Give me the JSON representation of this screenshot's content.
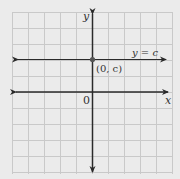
{
  "figure": {
    "type": "coordinate-plane",
    "background_color": "#ebebeb",
    "grid_color": "#c9c9c9",
    "axis_color": "#2a2a2a",
    "grid": {
      "left": 12,
      "top": 12,
      "right": 172,
      "bottom": 174,
      "spacing": 16
    },
    "axes": {
      "x_label": "x",
      "y_label": "y",
      "origin_label": "0"
    },
    "horizontal_line": {
      "label": "y = c",
      "point_label": "(0, c)"
    }
  }
}
